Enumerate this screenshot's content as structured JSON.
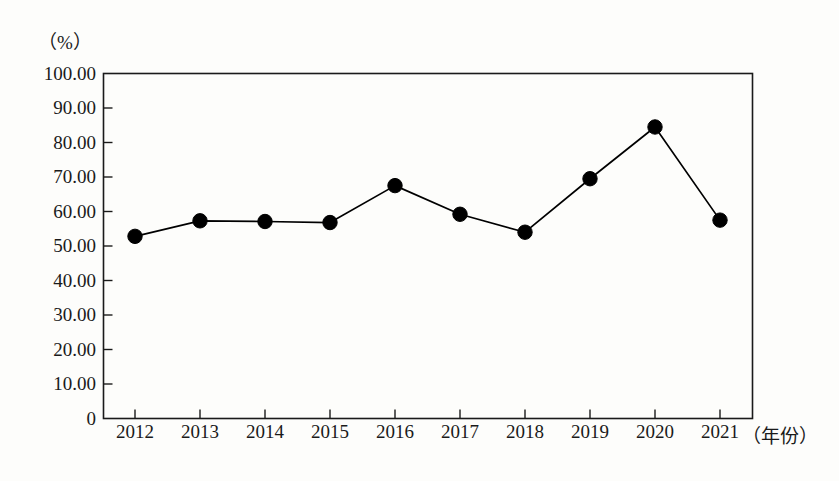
{
  "chart_data": {
    "type": "line",
    "title": "",
    "subtitle": "",
    "xlabel": "（年份）",
    "ylabel": "（%）",
    "categories": [
      "2012",
      "2013",
      "2014",
      "2015",
      "2016",
      "2017",
      "2018",
      "2019",
      "2020",
      "2021"
    ],
    "values": [
      52.8,
      57.3,
      57.1,
      56.8,
      67.5,
      59.2,
      54.0,
      69.5,
      84.5,
      57.5
    ],
    "series": [
      {
        "name": "",
        "values": [
          52.8,
          57.3,
          57.1,
          56.8,
          67.5,
          59.2,
          54.0,
          69.5,
          84.5,
          57.5
        ]
      }
    ],
    "ylim": [
      0,
      100
    ],
    "ytick_labels": [
      "0",
      "10.00",
      "20.00",
      "30.00",
      "40.00",
      "50.00",
      "60.00",
      "70.00",
      "80.00",
      "90.00",
      "100.00"
    ],
    "ytick_values": [
      0,
      10,
      20,
      30,
      40,
      50,
      60,
      70,
      80,
      90,
      100
    ],
    "grid": false,
    "legend": "none",
    "marker": "filled-circle",
    "marker_color": "#000000",
    "line_color": "#000000",
    "frame": "box",
    "background_color": "#fdfdfb"
  }
}
